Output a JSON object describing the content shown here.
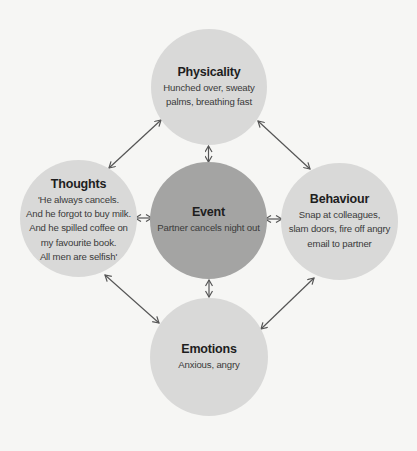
{
  "colors": {
    "background": "#f6f6f4",
    "outer_node_fill": "#d9d9d8",
    "center_node_fill": "#a4a4a3",
    "arrow": "#555555",
    "title_text": "#1e1e1e",
    "body_text": "#3a3a3a"
  },
  "diagram": {
    "nodes": {
      "physicality": {
        "title": "Physicality",
        "body": "Hunched over, sweaty\npalms, breathing fast"
      },
      "thoughts": {
        "title": "Thoughts",
        "body": "'He always cancels.\nAnd he forgot to buy milk.\nAnd he spilled coffee on\nmy favourite book.\nAll men are selfish'"
      },
      "event": {
        "title": "Event",
        "body": "Partner cancels night out"
      },
      "behaviour": {
        "title": "Behaviour",
        "body": "Snap at colleagues,\nslam doors, fire off angry\nemail to partner"
      },
      "emotions": {
        "title": "Emotions",
        "body": "Anxious, angry"
      }
    },
    "connections": [
      {
        "from": "thoughts",
        "to": "physicality",
        "type": "bidirectional"
      },
      {
        "from": "physicality",
        "to": "behaviour",
        "type": "bidirectional"
      },
      {
        "from": "thoughts",
        "to": "emotions",
        "type": "bidirectional"
      },
      {
        "from": "emotions",
        "to": "behaviour",
        "type": "bidirectional"
      },
      {
        "from": "physicality",
        "to": "event",
        "type": "bidirectional"
      },
      {
        "from": "event",
        "to": "emotions",
        "type": "bidirectional"
      },
      {
        "from": "thoughts",
        "to": "event",
        "type": "bidirectional"
      },
      {
        "from": "event",
        "to": "behaviour",
        "type": "bidirectional"
      }
    ]
  }
}
